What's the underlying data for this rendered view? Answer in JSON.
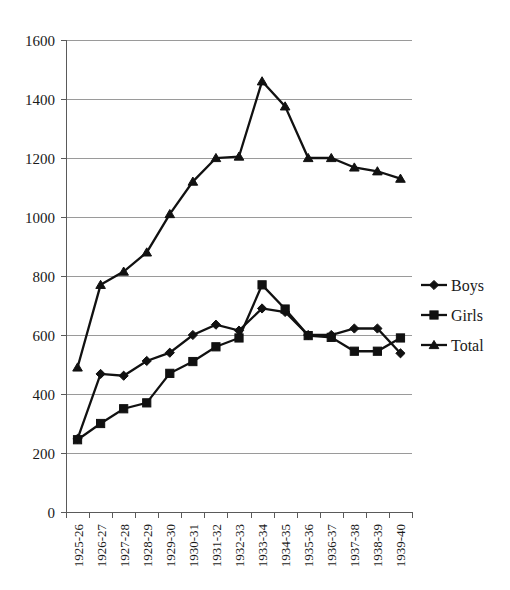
{
  "chart_data": {
    "type": "line",
    "title": "",
    "xlabel": "",
    "ylabel": "",
    "ylim": [
      0,
      1600
    ],
    "ytick_step": 200,
    "grid": true,
    "legend_position": "right",
    "categories": [
      "1925-26",
      "1926-27",
      "1927-28",
      "1928-29",
      "1929-30",
      "1930-31",
      "1931-32",
      "1932-33",
      "1933-34",
      "1934-35",
      "1935-36",
      "1936-37",
      "1937-38",
      "1938-39",
      "1939-40"
    ],
    "ytick_labels": [
      "0",
      "200",
      "400",
      "600",
      "800",
      "1000",
      "1200",
      "1400",
      "1600"
    ],
    "series": [
      {
        "name": "Boys",
        "marker": "diamond",
        "values": [
          248,
          468,
          462,
          512,
          540,
          600,
          635,
          615,
          690,
          678,
          600,
          600,
          622,
          622,
          538
        ]
      },
      {
        "name": "Girls",
        "marker": "square",
        "values": [
          245,
          300,
          350,
          370,
          470,
          510,
          560,
          590,
          770,
          688,
          598,
          592,
          545,
          545,
          590
        ]
      },
      {
        "name": "Total",
        "marker": "triangle",
        "values": [
          490,
          770,
          815,
          880,
          1010,
          1120,
          1200,
          1205,
          1460,
          1375,
          1200,
          1200,
          1168,
          1155,
          1130
        ]
      }
    ]
  },
  "legend": {
    "items": [
      {
        "label": "Boys"
      },
      {
        "label": "Girls"
      },
      {
        "label": "Total"
      }
    ]
  }
}
